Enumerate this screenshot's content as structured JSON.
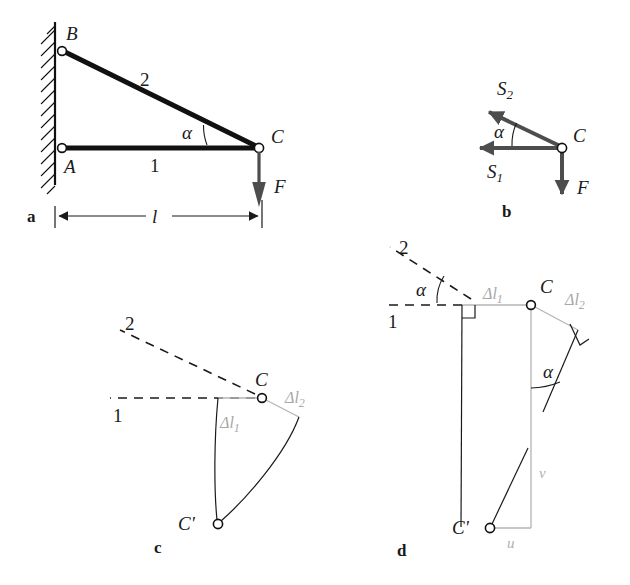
{
  "figure": {
    "background_color": "#ffffff",
    "ink_color": "#111111",
    "gray_color": "#b4b4b4",
    "vector_color": "#4d4d4d"
  },
  "panels": [
    {
      "key": "a",
      "label": "a",
      "caption": "Truss geometry with wall support, bars 1 and 2, load F and span l",
      "nodes": [
        {
          "name": "B",
          "label": "B",
          "x": 62,
          "y": 51
        },
        {
          "name": "A",
          "label": "A",
          "x": 62,
          "y": 148
        },
        {
          "name": "C",
          "label": "C",
          "x": 259,
          "y": 148
        }
      ],
      "bars": [
        {
          "name": "bar-1",
          "label": "1",
          "from": "A",
          "to": "C"
        },
        {
          "name": "bar-2",
          "label": "2",
          "from": "B",
          "to": "C"
        }
      ],
      "angle": {
        "label": "α",
        "name": "alpha"
      },
      "load": {
        "label": "F",
        "name": "force-F",
        "direction": "down"
      },
      "dimension": {
        "label": "l",
        "name": "span-l"
      }
    },
    {
      "key": "b",
      "label": "b",
      "caption": "Free-body diagram of joint C",
      "node": {
        "name": "C",
        "label": "C",
        "x": 562,
        "y": 148
      },
      "vectors": [
        {
          "name": "force-S2",
          "label": "S₂",
          "label_base": "S",
          "label_sub": "2",
          "direction": "up-left"
        },
        {
          "name": "force-S1",
          "label": "S₁",
          "label_base": "S",
          "label_sub": "1",
          "direction": "left"
        },
        {
          "name": "force-F",
          "label": "F",
          "direction": "down"
        }
      ],
      "angle": {
        "label": "α",
        "name": "alpha"
      }
    },
    {
      "key": "c",
      "label": "c",
      "caption": "Exact compatibility: bar elongations and circular arcs meeting at C'",
      "lines": [
        {
          "name": "bar-1-axis",
          "label": "1"
        },
        {
          "name": "bar-2-axis",
          "label": "2"
        }
      ],
      "nodes": [
        {
          "name": "C",
          "label": "C",
          "x": 262,
          "y": 398
        },
        {
          "name": "C-prime",
          "label": "C'",
          "x": 218,
          "y": 524
        }
      ],
      "elongations": [
        {
          "name": "delta-l1",
          "label": "Δl₁",
          "label_base": "Δl",
          "label_sub": "1"
        },
        {
          "name": "delta-l2",
          "label": "Δl₂",
          "label_base": "Δl",
          "label_sub": "2"
        }
      ]
    },
    {
      "key": "d",
      "label": "d",
      "caption": "Linearized displacement diagram with components u and v",
      "lines": [
        {
          "name": "bar-1-axis",
          "label": "1"
        },
        {
          "name": "bar-2-axis",
          "label": "2"
        }
      ],
      "nodes": [
        {
          "name": "C",
          "label": "C",
          "x": 531,
          "y": 305
        },
        {
          "name": "C-prime",
          "label": "C'",
          "x": 490,
          "y": 528
        }
      ],
      "elongations": [
        {
          "name": "delta-l1",
          "label": "Δl₁",
          "label_base": "Δl",
          "label_sub": "1"
        },
        {
          "name": "delta-l2",
          "label": "Δl₂",
          "label_base": "Δl",
          "label_sub": "2"
        }
      ],
      "angles": [
        {
          "name": "alpha-top",
          "label": "α"
        },
        {
          "name": "alpha-right",
          "label": "α"
        }
      ],
      "components": [
        {
          "name": "displacement-u",
          "label": "u"
        },
        {
          "name": "displacement-v",
          "label": "v"
        }
      ]
    }
  ]
}
